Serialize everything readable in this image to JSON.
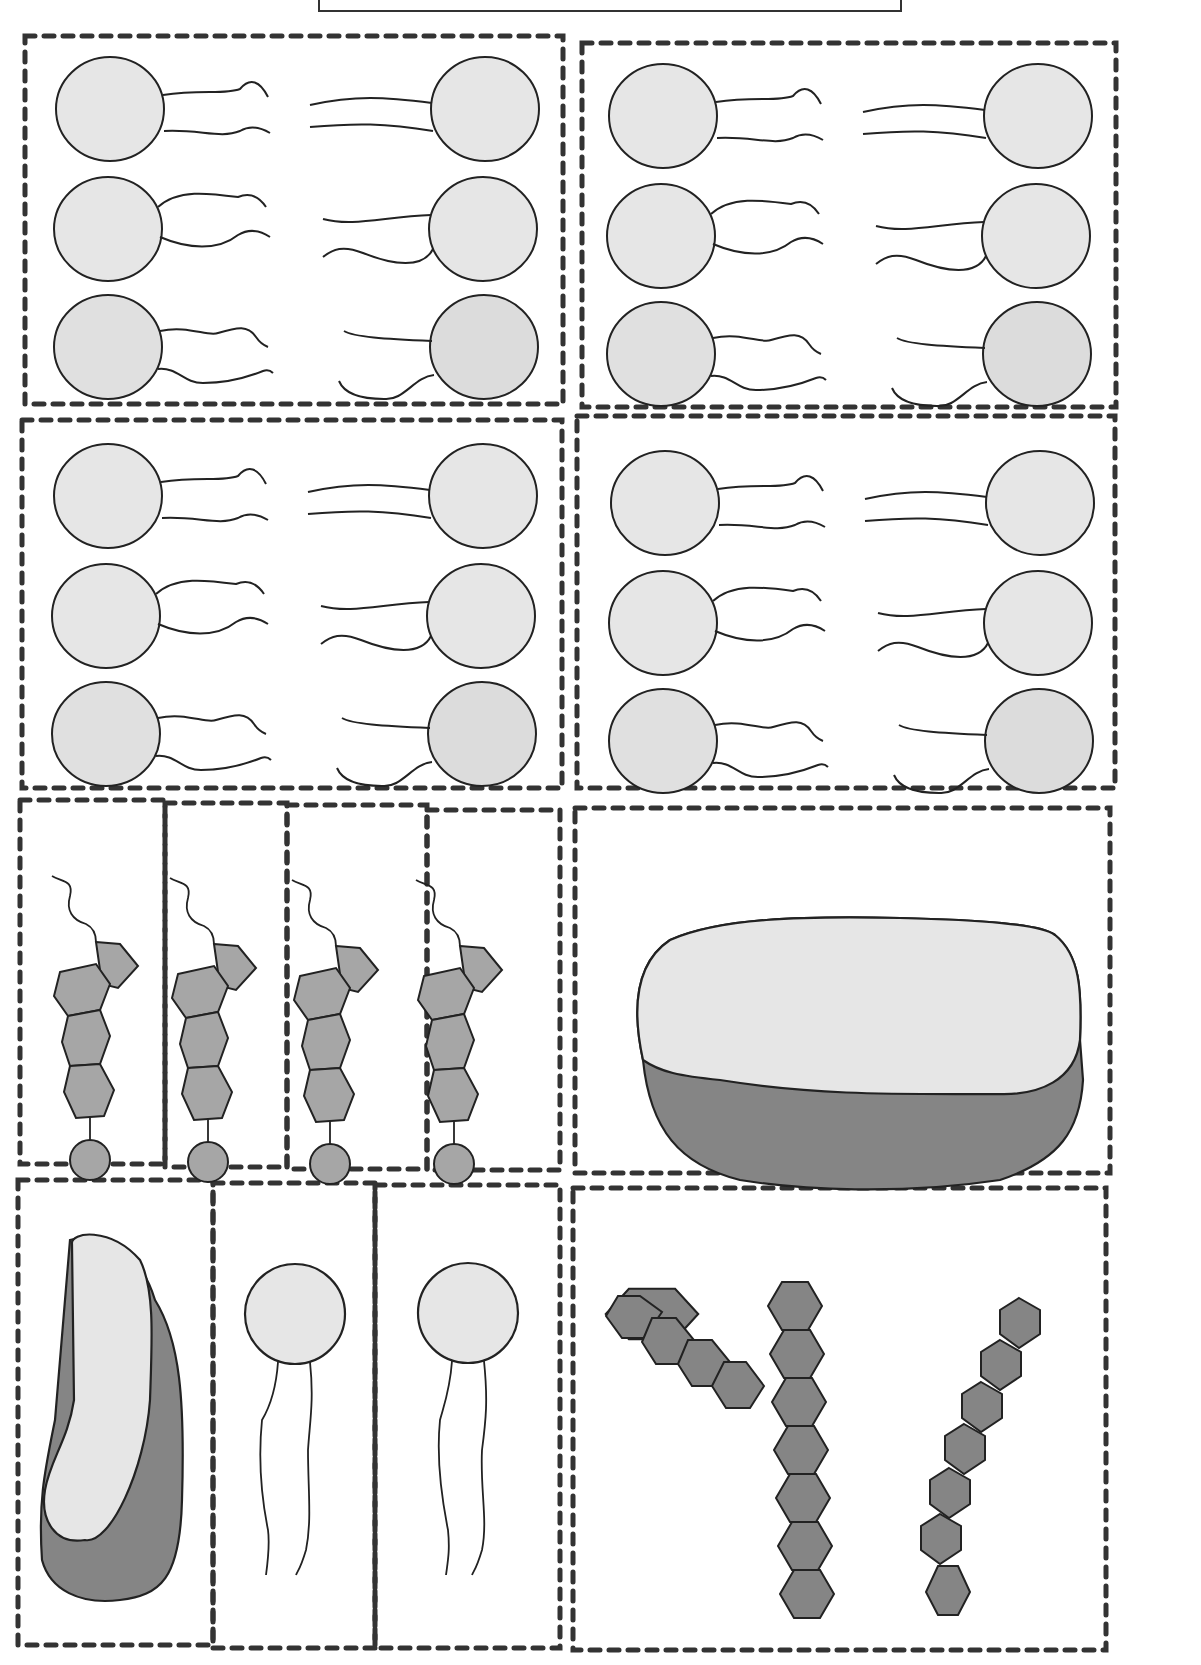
{
  "worksheet": {
    "title_box_text": "",
    "colors": {
      "light_fill": "#e6e6e6",
      "medium_fill": "#a6a6a6",
      "dark_fill": "#858585",
      "stroke": "#222222",
      "cut_line": "#333333"
    },
    "panels": [
      {
        "id": "bilayer-1",
        "type": "phospholipid-bilayer-segment",
        "pairs": 3
      },
      {
        "id": "bilayer-2",
        "type": "phospholipid-bilayer-segment",
        "pairs": 3
      },
      {
        "id": "bilayer-3",
        "type": "phospholipid-bilayer-segment",
        "pairs": 3
      },
      {
        "id": "bilayer-4",
        "type": "phospholipid-bilayer-segment",
        "pairs": 3
      },
      {
        "id": "cholesterol-set",
        "type": "cholesterol",
        "count": 4
      },
      {
        "id": "integral-protein-large",
        "type": "protein",
        "count": 1
      },
      {
        "id": "peripheral-protein",
        "type": "protein",
        "count": 1
      },
      {
        "id": "single-phospholipids",
        "type": "phospholipid",
        "count": 2
      },
      {
        "id": "carbohydrate-chains",
        "type": "carbohydrate",
        "count": 2,
        "branched": 1,
        "linear": 1
      }
    ]
  }
}
